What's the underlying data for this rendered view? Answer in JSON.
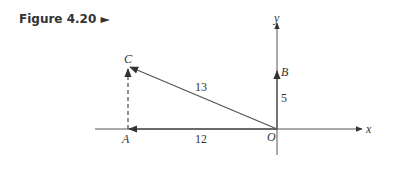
{
  "caption": {
    "text": "Figure 4.20 ►"
  },
  "diagram": {
    "axes": {
      "x_label": "x",
      "y_label": "y"
    },
    "points": {
      "origin": "O",
      "A": "A",
      "B": "B",
      "C": "C"
    },
    "lengths": {
      "OA": "12",
      "OB": "5",
      "OC": "13"
    },
    "colors": {
      "line": "#555555",
      "text": "#333333"
    }
  }
}
